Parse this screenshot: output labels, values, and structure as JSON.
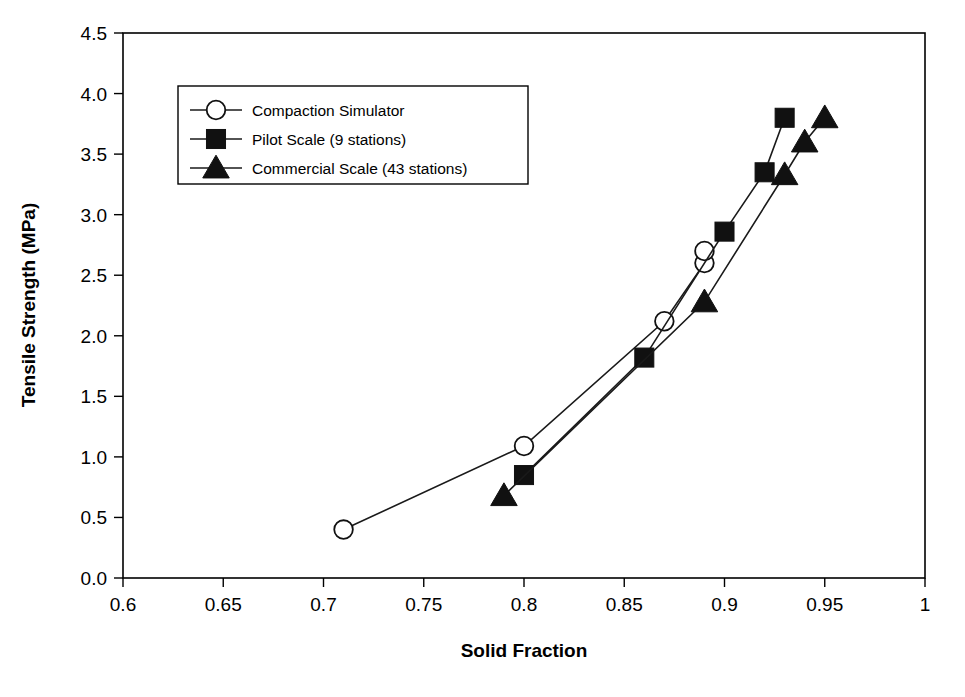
{
  "chart_data": {
    "type": "line",
    "title": "",
    "xlabel": "Solid Fraction",
    "ylabel": "Tensile Strength (MPa)",
    "xlim": [
      0.6,
      1.0
    ],
    "ylim": [
      0.0,
      4.5
    ],
    "xticks": [
      0.6,
      0.65,
      0.7,
      0.75,
      0.8,
      0.85,
      0.9,
      0.95,
      1
    ],
    "xticklabels": [
      "0.6",
      "0.65",
      "0.7",
      "0.75",
      "0.8",
      "0.85",
      "0.9",
      "0.95",
      "1"
    ],
    "yticks": [
      0.0,
      0.5,
      1.0,
      1.5,
      2.0,
      2.5,
      3.0,
      3.5,
      4.0,
      4.5
    ],
    "yticklabels": [
      "0.0",
      "0.5",
      "1.0",
      "1.5",
      "2.0",
      "2.5",
      "3.0",
      "3.5",
      "4.0",
      "4.5"
    ],
    "grid": false,
    "legend_position": "upper-left-inside",
    "series": [
      {
        "name": "Compaction Simulator",
        "marker": "open-circle",
        "color": "#111111",
        "points": [
          {
            "x": 0.71,
            "y": 0.4
          },
          {
            "x": 0.8,
            "y": 1.09
          },
          {
            "x": 0.87,
            "y": 2.12
          },
          {
            "x": 0.89,
            "y": 2.6
          },
          {
            "x": 0.89,
            "y": 2.7
          }
        ]
      },
      {
        "name": "Pilot Scale (9 stations)",
        "marker": "filled-square",
        "color": "#111111",
        "points": [
          {
            "x": 0.8,
            "y": 0.85
          },
          {
            "x": 0.86,
            "y": 1.82
          },
          {
            "x": 0.9,
            "y": 2.86
          },
          {
            "x": 0.92,
            "y": 3.35
          },
          {
            "x": 0.93,
            "y": 3.8
          }
        ]
      },
      {
        "name": "Commercial Scale (43 stations)",
        "marker": "filled-triangle",
        "color": "#111111",
        "points": [
          {
            "x": 0.79,
            "y": 0.68
          },
          {
            "x": 0.89,
            "y": 2.28
          },
          {
            "x": 0.93,
            "y": 3.33
          },
          {
            "x": 0.94,
            "y": 3.6
          },
          {
            "x": 0.95,
            "y": 3.8
          }
        ]
      }
    ]
  },
  "axes": {
    "x_title": "Solid Fraction",
    "y_title": "Tensile Strength (MPa)"
  },
  "legend": {
    "entries": [
      {
        "label": "Compaction Simulator",
        "marker": "open-circle"
      },
      {
        "label": "Pilot Scale (9 stations)",
        "marker": "filled-square"
      },
      {
        "label": "Commercial Scale (43 stations)",
        "marker": "filled-triangle"
      }
    ]
  },
  "caption": {
    "text": ""
  }
}
